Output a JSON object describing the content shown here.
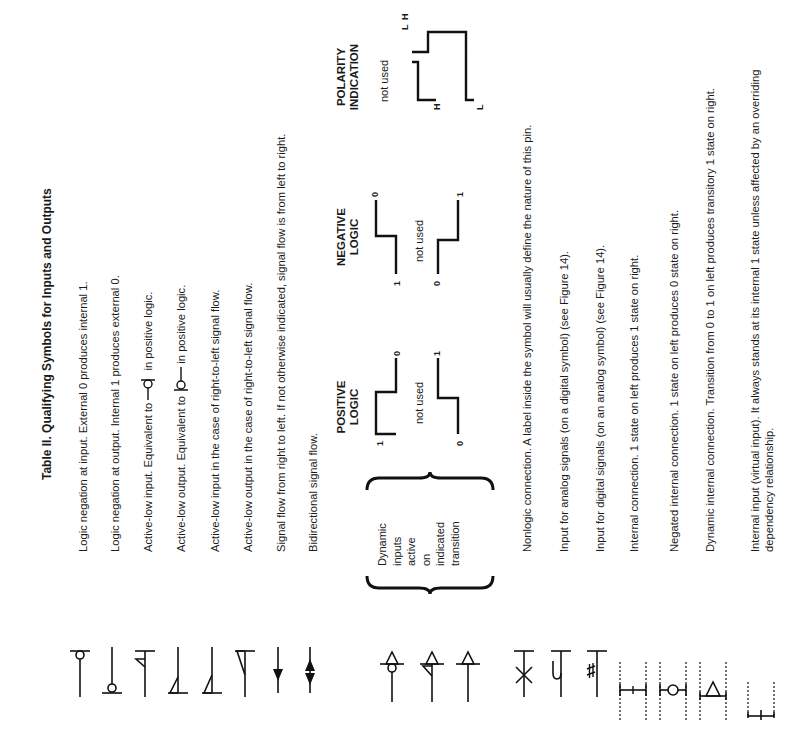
{
  "title": "Table II. Qualifying Symbols for Inputs and Outputs",
  "rows": [
    {
      "symbol": "logic-negation-input-symbol",
      "text": "Logic negation at input. External 0 produces internal 1."
    },
    {
      "symbol": "logic-negation-output-symbol",
      "text": "Logic negation at output. Internal 1 produces external 0."
    },
    {
      "symbol": "active-low-input-symbol",
      "text_before": "Active-low input. Equivalent to",
      "text_after": "in positive logic."
    },
    {
      "symbol": "active-low-output-symbol",
      "text_before": "Active-low output. Equivalent to",
      "text_after": "in positive logic."
    },
    {
      "symbol": "active-low-input-rtl-symbol",
      "text": "Active-low input in the case of right-to-left signal flow."
    },
    {
      "symbol": "active-low-output-rtl-symbol",
      "text": "Active-low output in the case of right-to-left signal flow."
    },
    {
      "symbol": "signal-flow-rtl-arrow-symbol",
      "text": "Signal flow from right to left. If not otherwise indicated, signal flow is from left to right."
    },
    {
      "symbol": "bidirectional-arrow-symbol",
      "text": "Bidirectional signal flow."
    }
  ],
  "dynamic": {
    "label_lines": [
      "Dynamic",
      "inputs",
      "active",
      "on",
      "indicated",
      "transition"
    ],
    "columns": [
      {
        "heading_lines": [
          "POSITIVE",
          "LOGIC"
        ],
        "not_used": "not used",
        "wave1": {
          "start": "1",
          "end": "0"
        },
        "wave2": {
          "start": "0",
          "end": "1"
        }
      },
      {
        "heading_lines": [
          "NEGATIVE",
          "LOGIC"
        ],
        "not_used": "not used",
        "wave1": {
          "start": "1",
          "end": "0"
        },
        "wave2": {
          "start": "0",
          "end": "1"
        }
      },
      {
        "heading_lines": [
          "POLARITY",
          "INDICATION"
        ],
        "not_used": "not used",
        "wave1": {
          "start": "H",
          "end": "L"
        },
        "wave2": {
          "start": "L",
          "end": "H"
        }
      }
    ]
  },
  "rows2": [
    {
      "symbol": "nonlogic-connection-symbol",
      "text": "Nonlogic connection. A label inside the symbol will usually define the nature of this pin."
    },
    {
      "symbol": "analog-input-symbol",
      "text": "Input for analog signals (on a digital symbol) (see Figure 14)."
    },
    {
      "symbol": "digital-input-symbol",
      "text": "Input for digital signals (on an analog symbol) (see Figure 14)."
    },
    {
      "symbol": "internal-connection-symbol",
      "text": "Internal connection. 1 state on left produces 1 state on right."
    },
    {
      "symbol": "negated-internal-connection-symbol",
      "text": "Negated internal connection. 1 state on left produces 0 state on right."
    },
    {
      "symbol": "dynamic-internal-connection-symbol",
      "text": "Dynamic internal connection. Transition from 0 to 1 on left produces transitory 1 state on right."
    },
    {
      "symbol": "internal-input-symbol",
      "text": "Internal input (virtual input). It always stands at its internal 1 state unless affected by an overriding dependency relationship."
    }
  ]
}
